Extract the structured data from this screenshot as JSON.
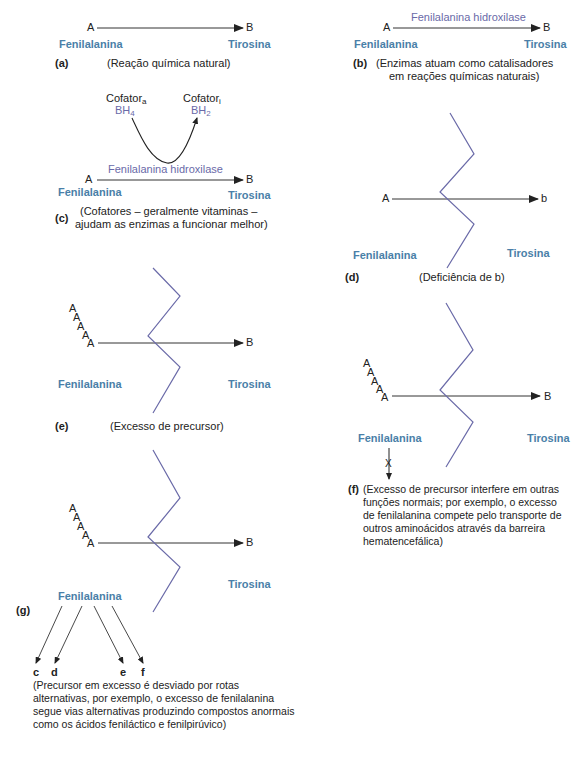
{
  "colors": {
    "compound_label": "#4a7fa8",
    "enzyme_label": "#6a6aa8",
    "block_zigzag": "#6a6aa8",
    "text": "#222222"
  },
  "common": {
    "substrate": "A",
    "product": "B",
    "product_lower": "b",
    "substrate_name": "Fenilalanina",
    "product_name": "Tirosina",
    "enzyme": "Fenilalanina hidroxilase",
    "blocked_mark": "X"
  },
  "panels": {
    "a": {
      "tag": "(a)",
      "caption": "(Reação química natural)"
    },
    "b": {
      "tag": "(b)",
      "caption_line1": "(Enzimas atuam como catalisadores",
      "caption_line2": "em reações químicas naturais)"
    },
    "c": {
      "tag": "(c)",
      "cofactor_a": "Cofator",
      "cofactor_a_sub": "a",
      "cofactor_i": "Cofator",
      "cofactor_i_sub": "i",
      "bh4": "BH",
      "bh4_sub": "4",
      "bh2": "BH",
      "bh2_sub": "2",
      "caption_line1": "(Cofatores – geralmente vitaminas –",
      "caption_line2": "ajudam as enzimas a funcionar melhor)"
    },
    "d": {
      "tag": "(d)",
      "caption": "(Deficiência de b)"
    },
    "e": {
      "tag": "(e)",
      "caption": "(Excesso de precursor)"
    },
    "f": {
      "tag": "(f)",
      "caption": "(Excesso de precursor interfere em outras funções normais; por exemplo, o excesso de fenilalanina compete pelo transporte de outros aminoácidos através da barreira hematencefálica)"
    },
    "g": {
      "tag": "(g)",
      "branches": [
        "c",
        "d",
        "e",
        "f"
      ],
      "caption": "(Precursor em excesso é desviado por rotas alternativas, por exemplo, o excesso de fenilalanina segue vias alternativas produzindo compostos anormais como os ácidos feniláctico e fenilpirúvico)"
    }
  }
}
